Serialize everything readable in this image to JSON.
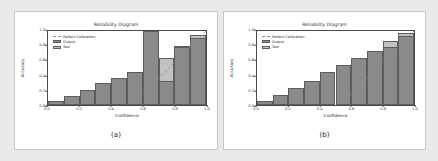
{
  "figure": {
    "background_color": "#e9e9e9",
    "panel_background": "#ffffff"
  },
  "colors": {
    "output_bar": "#8a8a8a",
    "test_bar": "#c2c2c2",
    "perfect_calibration_line": "#8f8f8f",
    "axis": "#4a4a4a"
  },
  "panels": [
    {
      "id": "a",
      "sublabel": "(a)",
      "legend": {
        "perfect": "Perfect Calibration",
        "output": "Output",
        "test": "Test"
      },
      "chart_data": {
        "type": "bar",
        "title": "Reliability Diagram",
        "xlabel": "Confidence",
        "ylabel": "Accuracy",
        "xlim": [
          0.0,
          1.0
        ],
        "ylim": [
          0.0,
          1.0
        ],
        "xticks": [
          "0.0",
          "0.2",
          "0.4",
          "0.6",
          "0.8",
          "1.0"
        ],
        "xtick_values": [
          0.0,
          0.2,
          0.4,
          0.6,
          0.8,
          1.0
        ],
        "yticks": [
          "0.0",
          "0.2",
          "0.4",
          "0.6",
          "0.8",
          "1.0"
        ],
        "ytick_values": [
          0.0,
          0.2,
          0.4,
          0.6,
          0.8,
          1.0
        ],
        "grid": false,
        "legend_position": "upper left",
        "bin_edges": [
          0.0,
          0.1,
          0.2,
          0.3,
          0.4,
          0.5,
          0.6,
          0.7,
          0.8,
          0.9,
          1.0
        ],
        "categories": [
          "0.0-0.1",
          "0.1-0.2",
          "0.2-0.3",
          "0.3-0.4",
          "0.4-0.5",
          "0.5-0.6",
          "0.6-0.7",
          "0.7-0.8",
          "0.8-0.9",
          "0.9-1.0"
        ],
        "series": [
          {
            "name": "Output",
            "color": "#8a8a8a",
            "values": [
              0.05,
              0.12,
              0.2,
              0.3,
              0.37,
              0.45,
              1.0,
              0.33,
              0.78,
              0.91
            ]
          },
          {
            "name": "Test",
            "color": "#c2c2c2",
            "values": [
              0.05,
              0.12,
              0.2,
              0.3,
              0.37,
              0.45,
              0.61,
              0.63,
              0.8,
              0.95
            ]
          }
        ],
        "reference_line": {
          "name": "Perfect Calibration",
          "style": "dashed",
          "from": [
            0.0,
            0.0
          ],
          "to": [
            1.0,
            1.0
          ]
        }
      }
    },
    {
      "id": "b",
      "sublabel": "(b)",
      "legend": {
        "perfect": "Perfect Calibration",
        "output": "Output",
        "test": "Test"
      },
      "chart_data": {
        "type": "bar",
        "title": "Reliability Diagram",
        "xlabel": "Confidence",
        "ylabel": "Accuracy",
        "xlim": [
          0.0,
          1.0
        ],
        "ylim": [
          0.0,
          1.0
        ],
        "xticks": [
          "0.0",
          "0.2",
          "0.4",
          "0.6",
          "0.8",
          "1.0"
        ],
        "xtick_values": [
          0.0,
          0.2,
          0.4,
          0.6,
          0.8,
          1.0
        ],
        "yticks": [
          "0.0",
          "0.2",
          "0.4",
          "0.6",
          "0.8",
          "1.0"
        ],
        "ytick_values": [
          0.0,
          0.2,
          0.4,
          0.6,
          0.8,
          1.0
        ],
        "grid": false,
        "legend_position": "upper left",
        "bin_edges": [
          0.0,
          0.1,
          0.2,
          0.3,
          0.4,
          0.5,
          0.6,
          0.7,
          0.8,
          0.9,
          1.0
        ],
        "categories": [
          "0.0-0.1",
          "0.1-0.2",
          "0.2-0.3",
          "0.3-0.4",
          "0.4-0.5",
          "0.5-0.6",
          "0.6-0.7",
          "0.7-0.8",
          "0.8-0.9",
          "0.9-1.0"
        ],
        "series": [
          {
            "name": "Output",
            "color": "#8a8a8a",
            "values": [
              0.05,
              0.14,
              0.23,
              0.33,
              0.44,
              0.54,
              0.64,
              0.73,
              0.79,
              0.93
            ]
          },
          {
            "name": "Test",
            "color": "#c2c2c2",
            "values": [
              0.05,
              0.14,
              0.23,
              0.33,
              0.44,
              0.54,
              0.64,
              0.73,
              0.86,
              0.97
            ]
          }
        ],
        "reference_line": {
          "name": "Perfect Calibration",
          "style": "dashed",
          "from": [
            0.0,
            0.0
          ],
          "to": [
            1.0,
            1.0
          ]
        }
      }
    }
  ]
}
